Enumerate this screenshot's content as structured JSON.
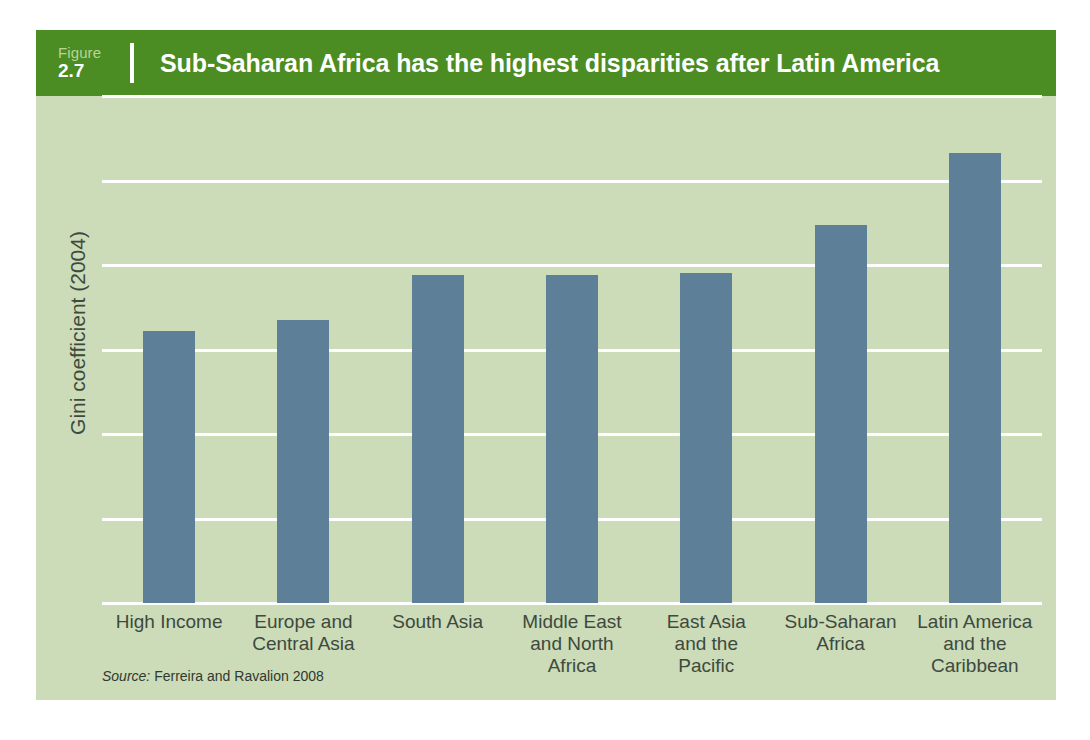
{
  "figure": {
    "label_word": "Figure",
    "number": "2.7",
    "title": "Sub-Saharan Africa has the highest disparities after Latin America"
  },
  "source": {
    "label": "Source:",
    "text": " Ferreira and Ravalion 2008"
  },
  "colors": {
    "header_green": "#4b8c23",
    "panel_background": "#ccdbb8",
    "bar_blue": "#5e7f98",
    "gridline_white": "#ffffff",
    "text_dark": "#3d4a3d"
  },
  "chart_data": {
    "type": "bar",
    "title": "Sub-Saharan Africa has the highest disparities after Latin America",
    "xlabel": "",
    "ylabel": "Gini coefficient (2004)",
    "ylim": [
      0,
      60
    ],
    "yticks": [
      0,
      10,
      20,
      30,
      40,
      50,
      60
    ],
    "ytick_labels": [
      "0",
      "10",
      "20",
      "30",
      "40",
      "50",
      "60"
    ],
    "grid": true,
    "legend": false,
    "categories": [
      "High Income",
      "Europe and Central Asia",
      "South Asia",
      "Middle East and North Africa",
      "East Asia and the Pacific",
      "Sub-Saharan Africa",
      "Latin America and the Caribbean"
    ],
    "category_lines": [
      [
        "High Income"
      ],
      [
        "Europe and",
        "Central Asia"
      ],
      [
        "South Asia"
      ],
      [
        "Middle East",
        "and North",
        "Africa"
      ],
      [
        "East Asia",
        "and the",
        "Pacific"
      ],
      [
        "Sub-Saharan",
        "Africa"
      ],
      [
        "Latin America",
        "and the",
        "Caribbean"
      ]
    ],
    "values": [
      32.2,
      33.5,
      38.8,
      38.8,
      39.0,
      44.7,
      53.2
    ],
    "series_name": "Gini coefficient (2004)"
  }
}
